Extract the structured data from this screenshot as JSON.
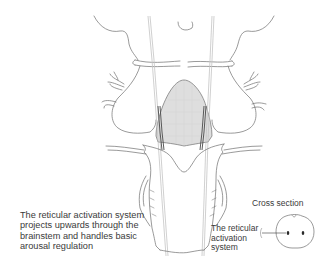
{
  "diagram": {
    "colors": {
      "outline": "#6f6f6f",
      "shaded_region": "#dcdcdc",
      "tract": "#4a4a4a",
      "text": "#3a3a3a",
      "background": "#ffffff"
    }
  },
  "labels": {
    "main_caption": "The reticular activation system\nprojects upwards through the\nbrainstem and handles basic\narousal regulation",
    "cross_section_title": "Cross section",
    "ras_label": "The reticular\nactivation\nsystem"
  }
}
